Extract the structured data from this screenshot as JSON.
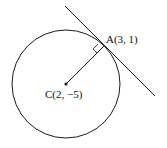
{
  "diagram": {
    "point_a_label": "A(3, 1)",
    "center_label": "C(2, −5)",
    "stroke_color": "#1a1a1a"
  }
}
